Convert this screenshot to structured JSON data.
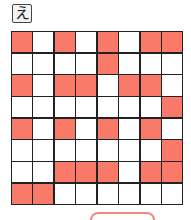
{
  "puzzle": {
    "label": "え",
    "rows": 8,
    "cols": 8,
    "fill_color": "#fa7a6a",
    "empty_color": "#ffffff",
    "grid": [
      [
        1,
        0,
        1,
        0,
        1,
        0,
        1,
        1
      ],
      [
        0,
        0,
        0,
        0,
        1,
        0,
        0,
        0
      ],
      [
        1,
        0,
        1,
        1,
        0,
        1,
        1,
        0
      ],
      [
        0,
        0,
        0,
        0,
        0,
        0,
        0,
        1
      ],
      [
        1,
        0,
        1,
        0,
        1,
        0,
        1,
        0
      ],
      [
        0,
        0,
        0,
        0,
        0,
        0,
        0,
        1
      ],
      [
        0,
        0,
        1,
        1,
        1,
        0,
        1,
        1
      ],
      [
        1,
        1,
        0,
        0,
        0,
        0,
        0,
        0
      ]
    ]
  },
  "button": {
    "label": ""
  }
}
